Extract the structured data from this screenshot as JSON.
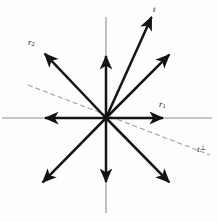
{
  "figure": {
    "width": 218,
    "height": 222,
    "background_color": "#fdfdfd",
    "origin": {
      "x": 106,
      "y": 118
    },
    "colors": {
      "vector_stroke": "#141414",
      "axis_stroke": "#8e8e8e",
      "dashed_stroke": "#a0a0a0",
      "label_text": "#1a1a1a",
      "marker_fill": "#141414"
    },
    "axes": [
      {
        "name": "horizontal-axis",
        "x1": 2,
        "y1": 118,
        "x2": 212,
        "y2": 118,
        "stroke_width": 1.1
      },
      {
        "name": "vertical-axis",
        "x1": 106,
        "y1": 17,
        "x2": 106,
        "y2": 213,
        "stroke_width": 1.1
      }
    ],
    "vectors": [
      {
        "name": "vector-r1",
        "x": 164,
        "y": 118,
        "stroke_width": 2.5,
        "marker": true
      },
      {
        "name": "vector-r1-opposite",
        "x": 44,
        "y": 118,
        "stroke_width": 2.5,
        "marker": true
      },
      {
        "name": "vector-up",
        "x": 106,
        "y": 55,
        "stroke_width": 2.5,
        "marker": true
      },
      {
        "name": "vector-down",
        "x": 106,
        "y": 183,
        "stroke_width": 2.5,
        "marker": true
      },
      {
        "name": "vector-t",
        "x": 152,
        "y": 16,
        "stroke_width": 2.5,
        "marker": false
      },
      {
        "name": "vector-t-opposite",
        "x": 42,
        "y": 183,
        "stroke_width": 2.5,
        "marker": false
      },
      {
        "name": "vector-upper-right",
        "x": 170,
        "y": 54,
        "stroke_width": 2.5,
        "marker": false
      },
      {
        "name": "vector-r2",
        "x": 44,
        "y": 53,
        "stroke_width": 2.5,
        "marker": false
      },
      {
        "name": "vector-r2-opposite",
        "x": 170,
        "y": 183,
        "stroke_width": 2.5,
        "marker": false
      }
    ],
    "dashed_line": {
      "name": "dashed-line-t-perp",
      "x1": 28,
      "y1": 85,
      "x2": 210,
      "y2": 155,
      "stroke_width": 1.1,
      "dash_pattern": "5 3"
    },
    "labels": [
      {
        "name": "label-t",
        "text": "t",
        "sub": "",
        "sup": "",
        "x": 153,
        "y": 5
      },
      {
        "name": "label-r2",
        "text": "r",
        "sub": "2",
        "sup": "",
        "x": 28,
        "y": 38
      },
      {
        "name": "label-r1",
        "text": "r",
        "sub": "1",
        "sup": "",
        "x": 159,
        "y": 100
      },
      {
        "name": "label-t-perp",
        "text": "t",
        "sub": "",
        "sup": "⊥",
        "x": 197,
        "y": 145
      }
    ]
  }
}
